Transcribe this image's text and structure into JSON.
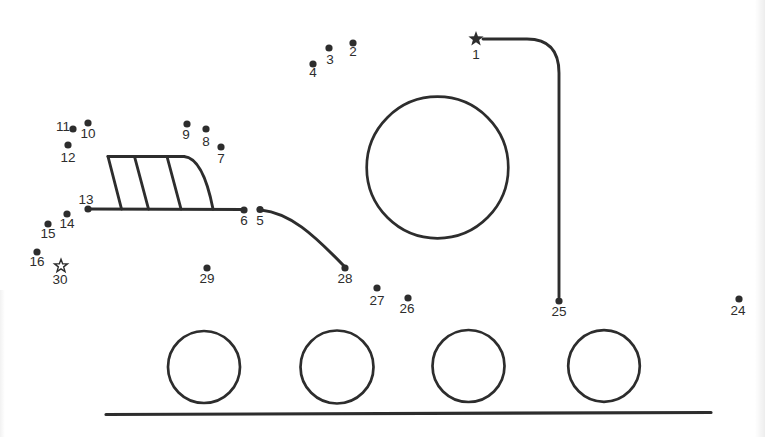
{
  "document": {
    "background": "#ffffff",
    "ink_color": "#2d2d2d",
    "label_color": "#2d2d2d"
  },
  "puzzle": {
    "type": "connect-the-dots-worksheet",
    "dot_radius": 3.6,
    "start_marker": {
      "number": "1",
      "marker": "filled-star",
      "x": 476,
      "y": 39,
      "outer_r": 8,
      "inner_r": 3.3,
      "label_x": 476,
      "label_y": 54
    },
    "finish_marker": {
      "number": "30",
      "marker": "outline-star",
      "x": 61,
      "y": 266,
      "outer_r": 6.8,
      "inner_r": 2.8,
      "label_x": 60,
      "label_y": 279
    },
    "dots": [
      {
        "n": "2",
        "x": 353,
        "y": 43,
        "lx": 353,
        "ly": 51
      },
      {
        "n": "3",
        "x": 329,
        "y": 48,
        "lx": 330,
        "ly": 59
      },
      {
        "n": "4",
        "x": 313,
        "y": 64,
        "lx": 313,
        "ly": 72
      },
      {
        "n": "5",
        "x": 260,
        "y": 209.5,
        "lx": 260,
        "ly": 220
      },
      {
        "n": "6",
        "x": 244,
        "y": 210,
        "lx": 244,
        "ly": 220
      },
      {
        "n": "7",
        "x": 221,
        "y": 147,
        "lx": 221,
        "ly": 158
      },
      {
        "n": "8",
        "x": 206,
        "y": 129,
        "lx": 206,
        "ly": 141
      },
      {
        "n": "9",
        "x": 187,
        "y": 124,
        "lx": 186,
        "ly": 134
      },
      {
        "n": "10",
        "x": 88,
        "y": 123,
        "lx": 88,
        "ly": 133
      },
      {
        "n": "11",
        "x": 73,
        "y": 129,
        "lx": 63,
        "ly": 126
      },
      {
        "n": "12",
        "x": 68,
        "y": 145,
        "lx": 68,
        "ly": 157
      },
      {
        "n": "13",
        "x": 88,
        "y": 209,
        "lx": 86,
        "ly": 199
      },
      {
        "n": "14",
        "x": 67,
        "y": 214,
        "lx": 67,
        "ly": 223
      },
      {
        "n": "15",
        "x": 48,
        "y": 224,
        "lx": 48,
        "ly": 233
      },
      {
        "n": "16",
        "x": 37,
        "y": 252,
        "lx": 37,
        "ly": 261
      },
      {
        "n": "24",
        "x": 739,
        "y": 299,
        "lx": 738,
        "ly": 310
      },
      {
        "n": "25",
        "x": 559,
        "y": 301,
        "lx": 559,
        "ly": 311
      },
      {
        "n": "26",
        "x": 408,
        "y": 298,
        "lx": 407,
        "ly": 308
      },
      {
        "n": "27",
        "x": 377,
        "y": 288,
        "lx": 377,
        "ly": 300
      },
      {
        "n": "28",
        "x": 345,
        "y": 268,
        "lx": 345,
        "ly": 278
      },
      {
        "n": "29",
        "x": 207,
        "y": 268,
        "lx": 207,
        "ly": 278
      }
    ]
  },
  "artwork": {
    "circles": [
      {
        "name": "engine-circle",
        "cx": 437.5,
        "cy": 167.5,
        "r": 70.8,
        "w": 2.7
      },
      {
        "name": "wheel-1-circle",
        "cx": 204,
        "cy": 367,
        "r": 36,
        "w": 2.7
      },
      {
        "name": "wheel-2-circle",
        "cx": 337,
        "cy": 367,
        "r": 36.5,
        "w": 2.7
      },
      {
        "name": "wheel-3-circle",
        "cx": 468.5,
        "cy": 366,
        "r": 36,
        "w": 2.7
      },
      {
        "name": "wheel-4-circle",
        "cx": 604,
        "cy": 366,
        "r": 35.8,
        "w": 2.7
      }
    ],
    "paths": [
      {
        "name": "crane-line-1-to-25",
        "d": "M 483 39 L 527 39 Q 559 39 559 73 L 559 297",
        "w": 2.9
      },
      {
        "name": "ladder-base-13-to-6",
        "d": "M 89 209 L 244 209.5",
        "w": 3.1
      },
      {
        "name": "ladder-left-edge",
        "d": "M 108 156.5 L 121.5 209",
        "w": 2.9
      },
      {
        "name": "ladder-top-edge",
        "d": "M 108 156.5 L 184 156.5",
        "w": 2.9
      },
      {
        "name": "ladder-right-curve",
        "d": "M 184 156.5 Q 203 158 213 209",
        "w": 2.9
      },
      {
        "name": "ladder-rung-1",
        "d": "M 134.5 156.5 L 148.5 209",
        "w": 2.9
      },
      {
        "name": "ladder-rung-2",
        "d": "M 167 156.5 L 181 209",
        "w": 2.9
      },
      {
        "name": "chute-curve-5-to-28",
        "d": "M 261 210 C 290 213 313 234 344 266",
        "w": 3
      },
      {
        "name": "ground-line",
        "d": "M 106 414.5 L 711 412.5",
        "w": 3.2
      }
    ]
  }
}
